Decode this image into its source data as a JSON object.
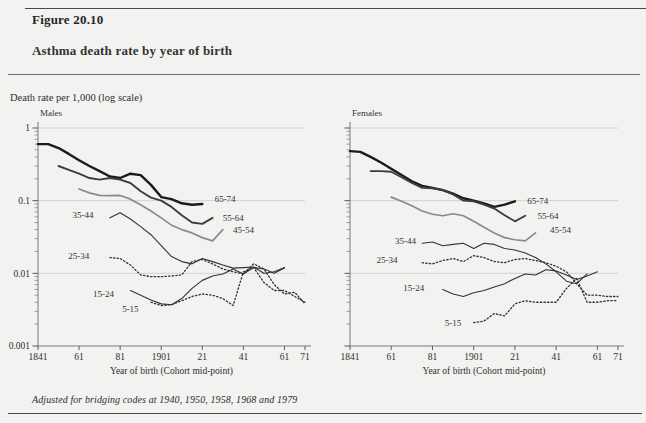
{
  "figure": {
    "number": "Figure 20.10",
    "title": "Asthma death rate by year of birth",
    "y_axis_note": "Death rate per 1,000 (log scale)",
    "footnote": "Adjusted for bridging codes at 1940, 1950, 1958, 1968 and 1979"
  },
  "chart_data": {
    "type": "line",
    "title": "Asthma death rate by year of birth",
    "subtitle": "Death rate per 1,000 (log scale)",
    "xlabel": "Year of birth (Cohort mid-point)",
    "ylabel": "Death rate per 1,000 (log scale)",
    "yscale": "log",
    "ylim": [
      0.001,
      1
    ],
    "ytick_labels": [
      "1",
      "0.1",
      "0.01",
      "0.001"
    ],
    "ytick_values": [
      1,
      0.1,
      0.01,
      0.001
    ],
    "xlim": [
      1841,
      1971
    ],
    "xtick_labels": [
      "1841",
      "61",
      "81",
      "1901",
      "21",
      "41",
      "61",
      "71"
    ],
    "xtick_values": [
      1841,
      1861,
      1881,
      1901,
      1921,
      1941,
      1961,
      1971
    ],
    "grid": "horizontal-major",
    "legend": "inline-end-labels",
    "annotation": "Adjusted for bridging codes at 1940, 1950, 1958, 1968 and 1979",
    "panels": [
      {
        "name": "Males",
        "series": [
          {
            "name": "65-74",
            "style": "solid",
            "width": 2.4,
            "color": "#1a1a1a",
            "label_x": 1927,
            "label_y": 0.105,
            "x": [
              1841,
              1846,
              1851,
              1856,
              1861,
              1866,
              1871,
              1876,
              1881,
              1886,
              1891,
              1896,
              1901,
              1906,
              1911,
              1916,
              1921
            ],
            "y": [
              0.6,
              0.6,
              0.53,
              0.44,
              0.36,
              0.3,
              0.255,
              0.215,
              0.205,
              0.235,
              0.225,
              0.165,
              0.112,
              0.105,
              0.092,
              0.088,
              0.09
            ]
          },
          {
            "name": "55-64",
            "style": "solid",
            "width": 1.9,
            "color": "#3d3d3d",
            "label_x": 1931,
            "label_y": 0.058,
            "x": [
              1851,
              1856,
              1861,
              1866,
              1871,
              1876,
              1881,
              1886,
              1891,
              1896,
              1901,
              1906,
              1911,
              1916,
              1921,
              1926
            ],
            "y": [
              0.3,
              0.265,
              0.235,
              0.205,
              0.195,
              0.205,
              0.195,
              0.175,
              0.135,
              0.11,
              0.1,
              0.082,
              0.063,
              0.05,
              0.048,
              0.058
            ]
          },
          {
            "name": "45-54",
            "style": "solid",
            "width": 1.7,
            "color": "#8a8a8a",
            "label_x": 1936,
            "label_y": 0.04,
            "x": [
              1861,
              1866,
              1871,
              1876,
              1881,
              1886,
              1891,
              1896,
              1901,
              1906,
              1911,
              1916,
              1921,
              1926,
              1931
            ],
            "y": [
              0.145,
              0.128,
              0.118,
              0.117,
              0.118,
              0.105,
              0.088,
              0.072,
              0.058,
              0.046,
              0.04,
              0.036,
              0.031,
              0.028,
              0.04
            ]
          },
          {
            "name": "35-44",
            "style": "solid",
            "width": 1.1,
            "color": "#333333",
            "label_x": 1868,
            "label_y": 0.063,
            "x": [
              1876,
              1881,
              1886,
              1891,
              1896,
              1901,
              1906,
              1911,
              1916,
              1921,
              1926,
              1931,
              1936,
              1941,
              1946,
              1951,
              1956,
              1961
            ],
            "y": [
              0.058,
              0.068,
              0.056,
              0.044,
              0.034,
              0.024,
              0.017,
              0.0145,
              0.0135,
              0.016,
              0.0145,
              0.013,
              0.0118,
              0.012,
              0.0122,
              0.01,
              0.0105,
              0.012
            ]
          },
          {
            "name": "25-34",
            "style": "dotted",
            "width": 1.3,
            "color": "#333333",
            "label_x": 1866,
            "label_y": 0.0175,
            "x": [
              1876,
              1881,
              1886,
              1891,
              1896,
              1901,
              1906,
              1911,
              1916,
              1921,
              1926,
              1931,
              1936,
              1941,
              1946,
              1951,
              1956,
              1961,
              1966,
              1971
            ],
            "y": [
              0.0165,
              0.016,
              0.013,
              0.0095,
              0.009,
              0.009,
              0.0092,
              0.0095,
              0.0145,
              0.0155,
              0.0135,
              0.0115,
              0.0105,
              0.0098,
              0.0135,
              0.0115,
              0.007,
              0.0052,
              0.0055,
              0.0038
            ]
          },
          {
            "name": "15-24",
            "style": "solid",
            "width": 1.1,
            "color": "#333333",
            "label_x": 1878,
            "label_y": 0.0052,
            "x": [
              1886,
              1891,
              1896,
              1901,
              1906,
              1911,
              1916,
              1921,
              1926,
              1931,
              1936,
              1941,
              1946,
              1951,
              1956,
              1961
            ],
            "y": [
              0.0058,
              0.005,
              0.0043,
              0.0038,
              0.0037,
              0.0045,
              0.0062,
              0.008,
              0.0092,
              0.0098,
              0.0115,
              0.0098,
              0.012,
              0.0115,
              0.01,
              0.0118
            ]
          },
          {
            "name": "5-15",
            "style": "dotted",
            "width": 1.3,
            "color": "#333333",
            "label_x": 1890,
            "label_y": 0.0032,
            "x": [
              1896,
              1901,
              1906,
              1911,
              1916,
              1921,
              1926,
              1931,
              1936,
              1941,
              1946,
              1951,
              1956,
              1961,
              1966,
              1971
            ],
            "y": [
              0.004,
              0.0036,
              0.0037,
              0.0042,
              0.0048,
              0.0052,
              0.005,
              0.0045,
              0.0036,
              0.0105,
              0.012,
              0.0075,
              0.0058,
              0.0058,
              0.0048,
              0.004
            ]
          }
        ]
      },
      {
        "name": "Females",
        "series": [
          {
            "name": "65-74",
            "style": "solid",
            "width": 2.4,
            "color": "#1a1a1a",
            "label_x": 1927,
            "label_y": 0.098,
            "x": [
              1841,
              1846,
              1851,
              1856,
              1861,
              1866,
              1871,
              1876,
              1881,
              1886,
              1891,
              1896,
              1901,
              1906,
              1911,
              1916,
              1921
            ],
            "y": [
              0.48,
              0.47,
              0.4,
              0.335,
              0.275,
              0.225,
              0.185,
              0.16,
              0.15,
              0.14,
              0.125,
              0.108,
              0.1,
              0.092,
              0.082,
              0.088,
              0.098
            ]
          },
          {
            "name": "55-64",
            "style": "solid",
            "width": 1.9,
            "color": "#3d3d3d",
            "label_x": 1932,
            "label_y": 0.062,
            "x": [
              1851,
              1856,
              1861,
              1866,
              1871,
              1876,
              1881,
              1886,
              1891,
              1896,
              1901,
              1906,
              1911,
              1916,
              1921,
              1926
            ],
            "y": [
              0.255,
              0.255,
              0.25,
              0.21,
              0.175,
              0.15,
              0.148,
              0.14,
              0.122,
              0.1,
              0.098,
              0.088,
              0.078,
              0.063,
              0.052,
              0.062
            ]
          },
          {
            "name": "45-54",
            "style": "solid",
            "width": 1.7,
            "color": "#8a8a8a",
            "label_x": 1938,
            "label_y": 0.04,
            "x": [
              1861,
              1866,
              1871,
              1876,
              1881,
              1886,
              1891,
              1896,
              1901,
              1906,
              1911,
              1916,
              1921,
              1926,
              1931
            ],
            "y": [
              0.112,
              0.098,
              0.085,
              0.072,
              0.065,
              0.062,
              0.066,
              0.062,
              0.052,
              0.043,
              0.036,
              0.031,
              0.029,
              0.028,
              0.036
            ]
          },
          {
            "name": "35-44",
            "style": "solid",
            "width": 1.1,
            "color": "#333333",
            "label_x": 1873,
            "label_y": 0.028,
            "x": [
              1876,
              1881,
              1886,
              1891,
              1896,
              1901,
              1906,
              1911,
              1916,
              1921,
              1926,
              1931,
              1936,
              1941,
              1946,
              1951,
              1956
            ],
            "y": [
              0.026,
              0.027,
              0.024,
              0.025,
              0.026,
              0.022,
              0.026,
              0.025,
              0.022,
              0.021,
              0.019,
              0.0165,
              0.0135,
              0.0105,
              0.0078,
              0.0072,
              0.0098
            ]
          },
          {
            "name": "25-34",
            "style": "dotted",
            "width": 1.3,
            "color": "#333333",
            "label_x": 1864,
            "label_y": 0.0155,
            "x": [
              1876,
              1881,
              1886,
              1891,
              1896,
              1901,
              1906,
              1911,
              1916,
              1921,
              1926,
              1931,
              1936,
              1941,
              1946,
              1951,
              1956,
              1961,
              1966,
              1971
            ],
            "y": [
              0.014,
              0.0135,
              0.015,
              0.016,
              0.0145,
              0.0175,
              0.0165,
              0.0145,
              0.014,
              0.0155,
              0.016,
              0.015,
              0.014,
              0.0125,
              0.0105,
              0.0072,
              0.005,
              0.005,
              0.0048,
              0.0048
            ]
          },
          {
            "name": "15-24",
            "style": "solid",
            "width": 1.1,
            "color": "#333333",
            "label_x": 1877,
            "label_y": 0.0062,
            "x": [
              1886,
              1891,
              1896,
              1901,
              1906,
              1911,
              1916,
              1921,
              1926,
              1931,
              1936,
              1941,
              1946,
              1951,
              1956,
              1961
            ],
            "y": [
              0.006,
              0.0052,
              0.0048,
              0.0054,
              0.0058,
              0.0065,
              0.0072,
              0.0085,
              0.0098,
              0.0095,
              0.0112,
              0.0108,
              0.0095,
              0.0082,
              0.0092,
              0.0105
            ]
          },
          {
            "name": "5-15",
            "style": "dotted",
            "width": 1.3,
            "color": "#333333",
            "label_x": 1895,
            "label_y": 0.0021,
            "x": [
              1901,
              1906,
              1911,
              1916,
              1921,
              1926,
              1931,
              1936,
              1941,
              1946,
              1951,
              1956,
              1961,
              1966,
              1971
            ],
            "y": [
              0.0021,
              0.0022,
              0.0028,
              0.0026,
              0.0038,
              0.0042,
              0.004,
              0.004,
              0.004,
              0.0062,
              0.0085,
              0.004,
              0.004,
              0.0042,
              0.0042
            ]
          }
        ]
      }
    ]
  }
}
